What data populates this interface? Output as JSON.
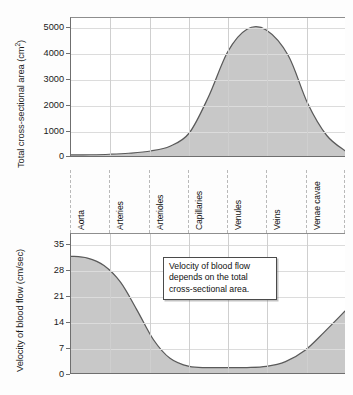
{
  "figure": {
    "name": "blood-vessel-cross-sectional-area-and-velocity"
  },
  "categories": [
    "Aorta",
    "Arteries",
    "Arterioles",
    "Capillaries",
    "Venules",
    "Veins",
    "Venae cavae"
  ],
  "annotation": {
    "text": "Velocity of blood flow depends on the total cross-sectional area."
  },
  "colors": {
    "fill": "#c3c3c3",
    "stroke": "#5a5a5a",
    "grid": "#d5d5d5",
    "axis": "#6f6f6f",
    "text": "#111111"
  },
  "chart_data": [
    {
      "type": "area",
      "id": "cross-sectional-area",
      "title": "",
      "xlabel": "",
      "ylabel": "Total cross-sectional area (cm2)",
      "ylabel_display": "Total cross-sectional area (cm",
      "ylabel_sup": "2",
      "ylabel_suffix": ")",
      "categories": [
        "Aorta",
        "Arteries",
        "Arterioles",
        "Capillaries",
        "Venules",
        "Veins",
        "Venae cavae"
      ],
      "ytick_labels": [
        "5000",
        "4000",
        "3000",
        "2000",
        "1000",
        "0"
      ],
      "ytick_values": [
        5000,
        4000,
        3000,
        2000,
        1000,
        0
      ],
      "ylim": [
        0,
        5600
      ],
      "grid": true,
      "legend": "none",
      "x": [
        0.0,
        0.07,
        0.14,
        0.21,
        0.29,
        0.36,
        0.43,
        0.5,
        0.57,
        0.64,
        0.71,
        0.79,
        0.86,
        0.93,
        1.0
      ],
      "values": [
        120,
        130,
        150,
        190,
        280,
        470,
        1000,
        2450,
        4250,
        5150,
        5120,
        4100,
        2200,
        900,
        260
      ],
      "peak_value": 5200,
      "peak_category": "Capillaries"
    },
    {
      "type": "area",
      "id": "blood-flow-velocity",
      "title": "",
      "xlabel": "",
      "ylabel": "Velocity of blood flow (cm/sec)",
      "categories": [
        "Aorta",
        "Arteries",
        "Arterioles",
        "Capillaries",
        "Venules",
        "Veins",
        "Venae cavae"
      ],
      "ytick_labels": [
        "35",
        "28",
        "21",
        "14",
        "7",
        "0"
      ],
      "ytick_values": [
        35,
        28,
        21,
        14,
        7,
        0
      ],
      "ylim": [
        0,
        38
      ],
      "grid": true,
      "legend": "none",
      "x": [
        0.0,
        0.06,
        0.12,
        0.18,
        0.24,
        0.3,
        0.36,
        0.43,
        0.5,
        0.57,
        0.64,
        0.71,
        0.78,
        0.85,
        0.92,
        1.0
      ],
      "values": [
        32.0,
        31.5,
        29.5,
        25.0,
        17.5,
        9.5,
        4.5,
        2.3,
        2.0,
        2.0,
        2.0,
        2.3,
        3.6,
        6.6,
        11.5,
        17.5
      ],
      "start_value": 32,
      "min_value": 2,
      "end_value": 17.5
    }
  ]
}
